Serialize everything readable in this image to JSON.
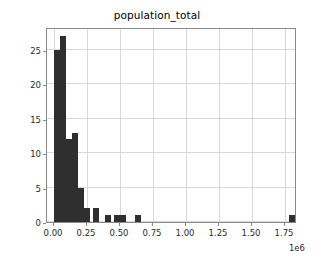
{
  "chart_data": {
    "type": "bar",
    "subtype": "histogram",
    "title": "population_total",
    "xlabel": "",
    "ylabel": "",
    "x_offset_text": "1e6",
    "x_scale_multiplier": 1000000,
    "xlim": [
      -0.0525,
      1.8375
    ],
    "ylim": [
      0,
      28.35
    ],
    "grid": true,
    "grid_color": "#d8d8d8",
    "bar_color": "#2f2f2f",
    "axes_color": "#8a8a8a",
    "legend": null,
    "legend_position": "none",
    "x_tick_labels": [
      "0.00",
      "0.25",
      "0.50",
      "0.75",
      "1.00",
      "1.25",
      "1.50",
      "1.75"
    ],
    "x_tick_values": [
      0.0,
      0.25,
      0.5,
      0.75,
      1.0,
      1.25,
      1.5,
      1.75
    ],
    "y_tick_labels": [
      "0",
      "5",
      "10",
      "15",
      "20",
      "25"
    ],
    "y_tick_values": [
      0,
      5,
      10,
      15,
      20,
      25
    ],
    "bin_width": 0.0455,
    "bin_edges": [
      0.0,
      0.0455,
      0.091,
      0.1365,
      0.182,
      0.2275,
      0.273,
      0.3185,
      0.364,
      0.4095,
      0.455,
      0.5005,
      0.546,
      0.5915,
      0.637,
      0.6825,
      0.728,
      0.7735,
      0.819,
      0.8645,
      0.91,
      0.9555,
      1.001,
      1.0465,
      1.092,
      1.1375,
      1.183,
      1.2285,
      1.274,
      1.3195,
      1.365,
      1.4105,
      1.456,
      1.5015,
      1.547,
      1.5925,
      1.638,
      1.6835,
      1.729,
      1.7745,
      1.82
    ],
    "categories": [
      "0.00-0.05",
      "0.05-0.09",
      "0.09-0.14",
      "0.14-0.18",
      "0.18-0.23",
      "0.23-0.27",
      "0.27-0.32",
      "0.32-0.36",
      "0.36-0.41",
      "0.41-0.46",
      "0.46-0.50",
      "0.50-0.55",
      "0.55-0.59",
      "0.59-0.64",
      "0.64-0.68",
      "0.68-0.73",
      "0.73-0.77",
      "0.77-0.82",
      "0.82-0.86",
      "0.86-0.91",
      "0.91-0.96",
      "0.96-1.00",
      "1.00-1.05",
      "1.05-1.09",
      "1.09-1.14",
      "1.14-1.18",
      "1.18-1.23",
      "1.23-1.27",
      "1.27-1.32",
      "1.32-1.37",
      "1.37-1.41",
      "1.41-1.46",
      "1.46-1.50",
      "1.50-1.55",
      "1.55-1.59",
      "1.59-1.64",
      "1.64-1.68",
      "1.68-1.73",
      "1.73-1.77",
      "1.77-1.82"
    ],
    "values": [
      25,
      27,
      12,
      13,
      5,
      2,
      2,
      0,
      1,
      0,
      1,
      1,
      0,
      1,
      1,
      0,
      0,
      0,
      0,
      0,
      0,
      0,
      0,
      0,
      0,
      0,
      0,
      0,
      0,
      0,
      0,
      0,
      0,
      0,
      0,
      0,
      0,
      0,
      0,
      1
    ],
    "bars": [
      {
        "x0": 0.0,
        "x1": 0.0455,
        "height": 25
      },
      {
        "x0": 0.0455,
        "x1": 0.091,
        "height": 27
      },
      {
        "x0": 0.091,
        "x1": 0.1365,
        "height": 12
      },
      {
        "x0": 0.1365,
        "x1": 0.182,
        "height": 13
      },
      {
        "x0": 0.182,
        "x1": 0.2275,
        "height": 5
      },
      {
        "x0": 0.2275,
        "x1": 0.273,
        "height": 2
      },
      {
        "x0": 0.2958,
        "x1": 0.3413,
        "height": 2
      },
      {
        "x0": 0.3868,
        "x1": 0.4323,
        "height": 1
      },
      {
        "x0": 0.455,
        "x1": 0.5005,
        "height": 1
      },
      {
        "x0": 0.5005,
        "x1": 0.546,
        "height": 1
      },
      {
        "x0": 0.6143,
        "x1": 0.6598,
        "height": 1
      },
      {
        "x0": 1.7745,
        "x1": 1.82,
        "height": 1
      }
    ]
  }
}
